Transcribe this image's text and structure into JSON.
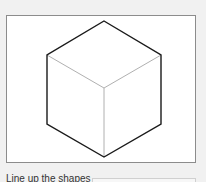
{
  "canvas": {
    "shape": "cube-wireframe",
    "outline_color": "#1a1a1a",
    "inner_edge_color": "#b0b0b0"
  },
  "instruction": {
    "text": "Line up the shapes"
  },
  "answer": {
    "value": ""
  }
}
